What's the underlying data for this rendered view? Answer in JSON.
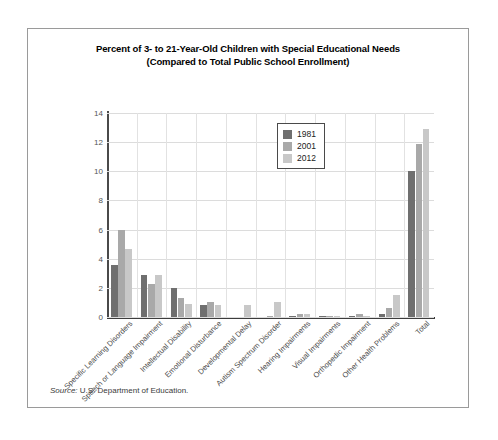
{
  "chart_data": {
    "type": "bar",
    "title": "Percent of 3- to 21-Year-Old Children with Special Educational Needs",
    "subtitle": "(Compared to Total Public School Enrollment)",
    "xlabel": "",
    "ylabel": "",
    "ylim": [
      0,
      14
    ],
    "yticks": [
      0,
      2,
      4,
      6,
      8,
      10,
      12,
      14
    ],
    "grid": true,
    "legend_position": "top-center",
    "categories": [
      "Specific Learning Disorders",
      "Speech or Language Impairment",
      "Intellectual Disability",
      "Emotional Disturbance",
      "Developmental Delay",
      "Autism Spectrum Disorder",
      "Hearing Impairments",
      "Visual Impairments",
      "Orthopedic Impairment",
      "Other Health Problems",
      "Total"
    ],
    "series": [
      {
        "name": "1981",
        "color": "#6f6f6f",
        "values": [
          3.6,
          2.9,
          2.0,
          0.8,
          0.0,
          0.0,
          0.1,
          0.1,
          0.1,
          0.2,
          10.0
        ]
      },
      {
        "name": "2001",
        "color": "#a9a9a9",
        "values": [
          6.0,
          2.3,
          1.3,
          1.0,
          0.0,
          0.1,
          0.2,
          0.1,
          0.2,
          0.6,
          11.9
        ]
      },
      {
        "name": "2012",
        "color": "#c8c8c8",
        "values": [
          4.7,
          2.9,
          0.9,
          0.8,
          0.8,
          1.0,
          0.2,
          0.1,
          0.1,
          1.5,
          12.9
        ]
      }
    ]
  },
  "source": {
    "keyword": "Source:",
    "text": " U.S. Department of Education."
  }
}
